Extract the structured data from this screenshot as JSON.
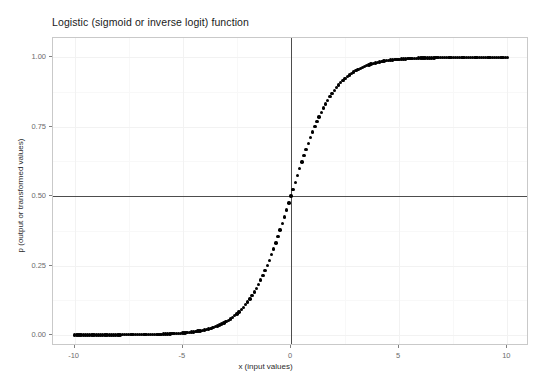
{
  "chart_data": {
    "type": "scatter",
    "title": "Logistic (sigmoid or inverse logit) function",
    "xlabel": "x (input values)",
    "ylabel": "p (output or transformed values)",
    "xlim": [
      -11.0,
      11.0
    ],
    "ylim": [
      -0.04,
      1.07
    ],
    "grid": true,
    "legend": null,
    "x_ticks": [
      {
        "value": -10,
        "label": "-10"
      },
      {
        "value": -5,
        "label": "-5"
      },
      {
        "value": 0,
        "label": "0"
      },
      {
        "value": 5,
        "label": "5"
      },
      {
        "value": 10,
        "label": "10"
      }
    ],
    "y_ticks": [
      {
        "value": 0.0,
        "label": "0.00"
      },
      {
        "value": 0.25,
        "label": "0.25"
      },
      {
        "value": 0.5,
        "label": "0.50"
      },
      {
        "value": 0.75,
        "label": "0.75"
      },
      {
        "value": 1.0,
        "label": "1.00"
      }
    ],
    "x_minor_ticks": [
      -7.5,
      -2.5,
      2.5,
      7.5
    ],
    "y_minor_ticks": [
      0.125,
      0.375,
      0.625,
      0.875
    ],
    "reference_lines": [
      {
        "orientation": "horizontal",
        "value": 0.5,
        "color": "#4d4d4d"
      },
      {
        "orientation": "vertical",
        "value": 0,
        "color": "#4d4d4d"
      }
    ],
    "series": [
      {
        "name": "logistic",
        "formula": "p = 1 / (1 + exp(-x))",
        "marker": "circle",
        "color": "#000000",
        "x_start": -10,
        "x_end": 10,
        "x_step": 0.1,
        "n_points": 201,
        "x": [
          -10,
          -9.5,
          -9,
          -8.5,
          -8,
          -7.5,
          -7,
          -6.5,
          -6,
          -5.5,
          -5,
          -4.5,
          -4,
          -3.5,
          -3,
          -2.5,
          -2,
          -1.5,
          -1,
          -0.5,
          0,
          0.5,
          1,
          1.5,
          2,
          2.5,
          3,
          3.5,
          4,
          4.5,
          5,
          5.5,
          6,
          6.5,
          7,
          7.5,
          8,
          8.5,
          9,
          9.5,
          10
        ],
        "y": [
          4.54e-05,
          7.49e-05,
          0.0001234,
          0.0002034,
          0.0003354,
          0.0005527,
          0.0009111,
          0.0015012,
          0.0024726,
          0.0040701,
          0.0066929,
          0.0109869,
          0.0179862,
          0.0293122,
          0.0474259,
          0.0758582,
          0.1192029,
          0.1824255,
          0.2689414,
          0.3775407,
          0.5,
          0.6224593,
          0.7310586,
          0.8175745,
          0.8807971,
          0.9241418,
          0.9525741,
          0.9706878,
          0.9820138,
          0.9890131,
          0.9933071,
          0.9959299,
          0.9975274,
          0.9984988,
          0.9990889,
          0.9994473,
          0.9996646,
          0.9997966,
          0.9998766,
          0.9999251,
          0.9999546
        ]
      }
    ]
  }
}
